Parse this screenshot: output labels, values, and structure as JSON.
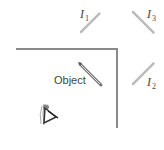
{
  "diagram": {
    "object_label": "Object",
    "images": [
      {
        "id": "I1",
        "letter": "I",
        "subscript": "1"
      },
      {
        "id": "I2",
        "letter": "I",
        "subscript": "2"
      },
      {
        "id": "I3",
        "letter": "I",
        "subscript": "3"
      }
    ],
    "colors": {
      "mirror": "#8a8a8a",
      "object": "#777777",
      "image": "#bbbbbb",
      "text": "#444444"
    }
  }
}
